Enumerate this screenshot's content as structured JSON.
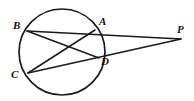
{
  "figure": {
    "kind": "circle-secants-geometry-diagram",
    "background_color": "#ffffff",
    "stroke_color": "#1a1a1a",
    "canvas": {
      "width": 194,
      "height": 101
    },
    "circle": {
      "cx": 62,
      "cy": 52,
      "r": 43
    },
    "points": [
      {
        "id": "B",
        "label": "B",
        "x": 27,
        "y": 31,
        "on_circle": true
      },
      {
        "id": "A",
        "label": "A",
        "x": 95,
        "y": 30,
        "on_circle": true
      },
      {
        "id": "C",
        "label": "C",
        "x": 28,
        "y": 73,
        "on_circle": true
      },
      {
        "id": "D",
        "label": "D",
        "x": 99,
        "y": 58,
        "on_circle": true
      },
      {
        "id": "P",
        "label": "P",
        "x": 181,
        "y": 39,
        "on_circle": false
      }
    ],
    "segments": [
      {
        "id": "BP",
        "from": "B",
        "to": "P",
        "note": "secant through A"
      },
      {
        "id": "CP",
        "from": "C",
        "to": "P",
        "note": "secant through D"
      },
      {
        "id": "BD",
        "from": "B",
        "to": "D",
        "note": "chord"
      },
      {
        "id": "CA",
        "from": "C",
        "to": "A",
        "note": "chord"
      }
    ],
    "labels": {
      "B": "B",
      "A": "A",
      "C": "C",
      "D": "D",
      "P": "P"
    }
  }
}
